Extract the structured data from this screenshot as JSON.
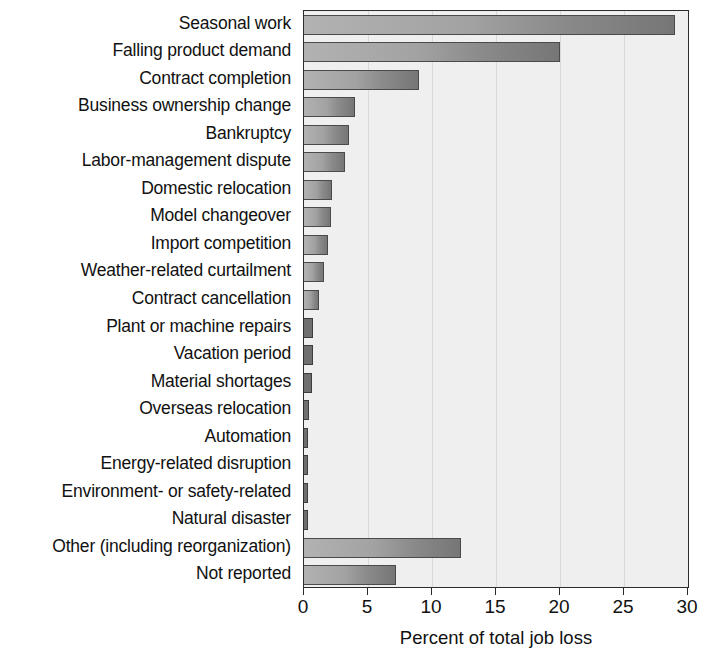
{
  "chart_data": {
    "type": "bar",
    "orientation": "horizontal",
    "title": "",
    "subtitle": "",
    "xlabel": "Percent of total job loss",
    "ylabel": "",
    "xlim": [
      0,
      30
    ],
    "xticks": [
      0,
      5,
      10,
      15,
      20,
      25,
      30
    ],
    "xtick_labels": [
      "0",
      "5",
      "10",
      "15",
      "20",
      "25",
      "30"
    ],
    "grid": "vertical",
    "legend": "none",
    "categories": [
      "Seasonal work",
      "Falling product demand",
      "Contract completion",
      "Business ownership change",
      "Bankruptcy",
      "Labor-management dispute",
      "Domestic relocation",
      "Model changeover",
      "Import competition",
      "Weather-related curtailment",
      "Contract cancellation",
      "Plant or machine repairs",
      "Vacation period",
      "Material shortages",
      "Overseas relocation",
      "Automation",
      "Energy-related disruption",
      "Environment- or safety-related",
      "Natural disaster",
      "Other (including reorganization)",
      "Not reported"
    ],
    "values": [
      29.0,
      20.0,
      9.0,
      4.0,
      3.5,
      3.2,
      2.2,
      2.1,
      1.9,
      1.6,
      1.2,
      0.7,
      0.7,
      0.6,
      0.4,
      0.3,
      0.3,
      0.3,
      0.3,
      12.3,
      7.2
    ],
    "colors": {
      "bar_light": "#b2b2b2",
      "bar_dark": "#767676",
      "bar_border": "#4a4a4a",
      "plot_background": "#efefef",
      "gridline": "#d9d9d9",
      "axis": "#2b2b2b",
      "text": "#111111"
    }
  }
}
